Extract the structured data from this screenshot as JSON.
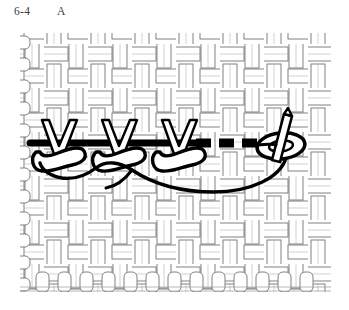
{
  "figure": {
    "number": "6-4",
    "letter": "A",
    "colors": {
      "background": "#ffffff",
      "ink": "#000000",
      "weave_line": "#555555",
      "weave_shade": "#8c8c8c",
      "caption_text": "#3a3a3a",
      "thread_fill": "#ffffff"
    }
  },
  "fabric": {
    "label": "woven-fabric-swatch",
    "left": 20,
    "top": 33,
    "right": 331,
    "bottom": 292,
    "weave_type": "plain-basket-weave",
    "cell_size": 22,
    "columns": 14,
    "rows": 12
  },
  "embroidery": {
    "label": "chain-stitch-row",
    "stitch_count": 3,
    "baseline_y": 158,
    "v_legs": [
      {
        "apex_x": 58,
        "apex_y": 158,
        "left_top_x": 42,
        "right_top_x": 74,
        "top_y": 120
      },
      {
        "apex_x": 118,
        "apex_y": 158,
        "left_top_x": 102,
        "right_top_x": 134,
        "top_y": 120
      },
      {
        "apex_x": 178,
        "apex_y": 158,
        "left_top_x": 162,
        "right_top_x": 194,
        "top_y": 120
      }
    ],
    "loops": [
      {
        "center_x": 62,
        "center_y": 160
      },
      {
        "center_x": 122,
        "center_y": 160
      },
      {
        "center_x": 182,
        "center_y": 160
      }
    ],
    "working_thread": {
      "label": "thread-tail-curve",
      "from_x": 286,
      "from_y": 152,
      "to_x": 52,
      "to_y": 172
    },
    "under_fabric_thread": {
      "label": "dashed-thread-under-fabric",
      "y": 142,
      "start_x": 196,
      "end_x": 272,
      "dash_pattern": "14 7"
    }
  },
  "needle": {
    "label": "threaded-needle",
    "tip_x": 294,
    "tip_y": 118,
    "eye_center_x": 282,
    "eye_center_y": 145,
    "angle_deg": 22,
    "length": 62
  }
}
